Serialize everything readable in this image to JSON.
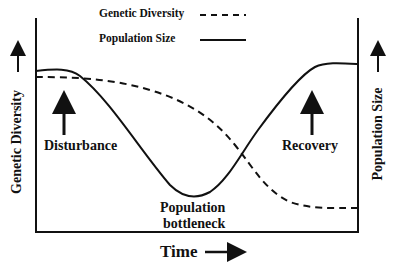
{
  "legend": {
    "items": [
      {
        "label": "Genetic Diversity",
        "style": "dashed"
      },
      {
        "label": "Population Size",
        "style": "solid"
      }
    ]
  },
  "axes": {
    "x_label": "Time",
    "left_label": "Genetic Diversity",
    "right_label": "Population Size"
  },
  "annotations": {
    "disturbance": "Disturbance",
    "bottleneck_line1": "Population",
    "bottleneck_line2": "bottleneck",
    "recovery": "Recovery"
  },
  "colors": {
    "line": "#111111",
    "background": "#ffffff"
  }
}
